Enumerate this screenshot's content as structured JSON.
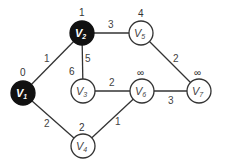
{
  "graph": {
    "nodes": [
      {
        "id": "V1",
        "name": "V",
        "sub": "1",
        "dist": "0",
        "known": true
      },
      {
        "id": "V2",
        "name": "V",
        "sub": "2",
        "dist": "1",
        "known": true
      },
      {
        "id": "V3",
        "name": "V",
        "sub": "3",
        "dist": "6",
        "known": false
      },
      {
        "id": "V4",
        "name": "V",
        "sub": "4",
        "dist": "2",
        "known": false
      },
      {
        "id": "V5",
        "name": "V",
        "sub": "5",
        "dist": "4",
        "known": false
      },
      {
        "id": "V6",
        "name": "V",
        "sub": "6",
        "dist": "∞",
        "known": false
      },
      {
        "id": "V7",
        "name": "V",
        "sub": "7",
        "dist": "∞",
        "known": false
      }
    ],
    "edges": [
      {
        "from": "V1",
        "to": "V2",
        "weight": "1"
      },
      {
        "from": "V1",
        "to": "V4",
        "weight": "2"
      },
      {
        "from": "V2",
        "to": "V5",
        "weight": "3"
      },
      {
        "from": "V2",
        "to": "V3",
        "weight": "5"
      },
      {
        "from": "V3",
        "to": "V6",
        "weight": "2"
      },
      {
        "from": "V4",
        "to": "V6",
        "weight": "1"
      },
      {
        "from": "V5",
        "to": "V7",
        "weight": "2"
      },
      {
        "from": "V6",
        "to": "V7",
        "weight": "3"
      }
    ]
  }
}
